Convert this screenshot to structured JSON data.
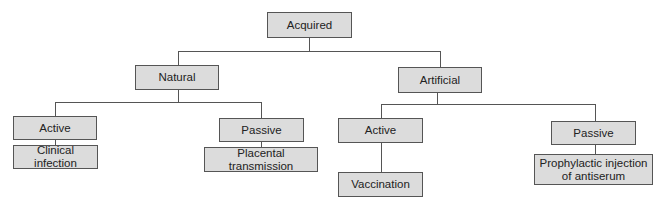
{
  "diagram": {
    "type": "tree",
    "root": {
      "id": "acquired",
      "label": "Acquired"
    },
    "level1": [
      {
        "id": "natural",
        "label": "Natural"
      },
      {
        "id": "artificial",
        "label": "Artificial"
      }
    ],
    "level2": [
      {
        "id": "natural-active",
        "label": "Active",
        "parent": "natural"
      },
      {
        "id": "natural-passive",
        "label": "Passive",
        "parent": "natural"
      },
      {
        "id": "artificial-active",
        "label": "Active",
        "parent": "artificial"
      },
      {
        "id": "artificial-passive",
        "label": "Passive",
        "parent": "artificial"
      }
    ],
    "level3": [
      {
        "id": "clinical-infection",
        "label": "Clinical infection",
        "parent": "natural-active"
      },
      {
        "id": "placental-transmission",
        "label": "Placental transmission",
        "parent": "natural-passive"
      },
      {
        "id": "vaccination",
        "label": "Vaccination",
        "parent": "artificial-active"
      },
      {
        "id": "prophylactic-injection",
        "label": "Prophylactic injection of antiserum",
        "parent": "artificial-passive"
      }
    ]
  },
  "colors": {
    "box_fill": "#dcdcdc",
    "box_border": "#555555",
    "line": "#555555"
  }
}
